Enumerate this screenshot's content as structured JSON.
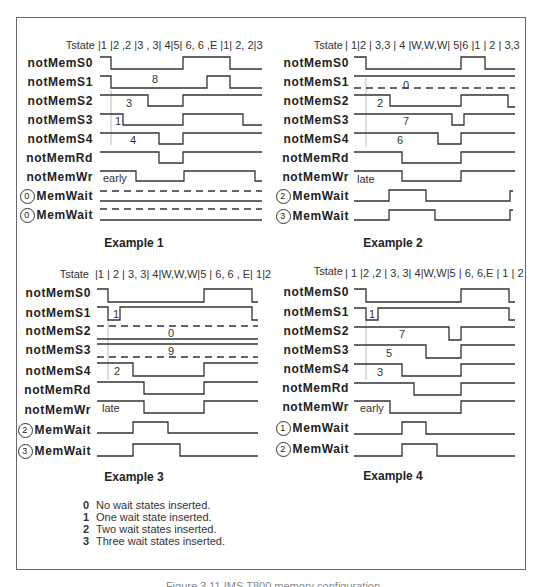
{
  "examples": [
    {
      "title": "Example 1",
      "tstate_label": "Tstate",
      "tstates": "|1 |2 ,2 |3 , 3| 4|5| 6, 6 ,E |1| 2, 2|3",
      "signals": [
        "notMemS0",
        "notMemS1",
        "notMemS2",
        "notMemS3",
        "notMemS4",
        "notMemRd",
        "notMemWr"
      ],
      "memwait": [
        {
          "circle": "0",
          "label": "MemWait"
        },
        {
          "circle": "0",
          "label": "MemWait"
        }
      ],
      "notes": {
        "s1": "8",
        "s2": "3",
        "s3": "1",
        "s4": "4",
        "wr": "early"
      }
    },
    {
      "title": "Example 2",
      "tstate_label": "Tstate",
      "tstates": "| 1|2 | 3,3 | 4 |W,W,W| 5|6 |1 | 2 | 3,3",
      "signals": [
        "notMemS0",
        "notMemS1",
        "notMemS2",
        "notMemS3",
        "notMemS4",
        "notMemRd",
        "notMemWr"
      ],
      "memwait": [
        {
          "circle": "2",
          "label": "MemWait"
        },
        {
          "circle": "3",
          "label": "MemWait"
        }
      ],
      "notes": {
        "s1": "0",
        "s2": "2",
        "s3": "7",
        "s4": "6",
        "wr": "late"
      }
    },
    {
      "title": "Example 3",
      "tstate_label": "Tstate",
      "tstates": "|1 | 2 | 3, 3| 4|W,W,W|5 | 6, 6 , E| 1|2",
      "signals": [
        "notMemS0",
        "notMemS1",
        "notMemS2",
        "notMemS3",
        "notMemS4",
        "notMemRd",
        "notMemWr"
      ],
      "memwait": [
        {
          "circle": "2",
          "label": "MemWait"
        },
        {
          "circle": "3",
          "label": "MemWait"
        }
      ],
      "notes": {
        "s1": "1",
        "s2": "0",
        "s3": "9",
        "s4": "2",
        "wr": "late"
      }
    },
    {
      "title": "Example 4",
      "tstate_label": "Tstate",
      "tstates": "| 1 |2 ,2 | 3, 3| 4|W,W|5 | 6, 6,E | 1 | 2",
      "signals": [
        "notMemS0",
        "notMemS1",
        "notMemS2",
        "notMemS3",
        "notMemS4",
        "notMemRd",
        "notMemWr"
      ],
      "memwait": [
        {
          "circle": "1",
          "label": "MemWait"
        },
        {
          "circle": "2",
          "label": "MemWait"
        }
      ],
      "notes": {
        "s1": "1",
        "s2": "7",
        "s3": "5",
        "s4": "3",
        "wr": "early"
      }
    }
  ],
  "legend": [
    {
      "key": "0",
      "text": "No wait states inserted."
    },
    {
      "key": "1",
      "text": "One wait state inserted."
    },
    {
      "key": "2",
      "text": "Two wait states inserted."
    },
    {
      "key": "3",
      "text": "Three wait states inserted."
    }
  ],
  "caption": "Figure 3.11 IMS T800 memory configuration"
}
